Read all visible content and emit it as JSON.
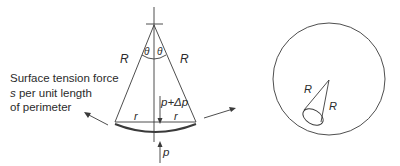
{
  "left_diagram": {
    "labels": {
      "R_left": "R",
      "R_right": "R",
      "theta_left": "θ",
      "theta_right": "θ",
      "r_left": "r",
      "r_right": "r",
      "pressure_inside": "p+Δp",
      "pressure_outside": "p"
    },
    "description": {
      "line1": "Surface tension force",
      "line2_var": "s",
      "line2_rest": " per unit length",
      "line3": "of perimeter"
    }
  },
  "right_diagram": {
    "labels": {
      "R_left": "R",
      "R_right": "R"
    }
  },
  "colors": {
    "stroke": "#3a3a3a",
    "text": "#2b2b2b",
    "background": "#ffffff"
  }
}
